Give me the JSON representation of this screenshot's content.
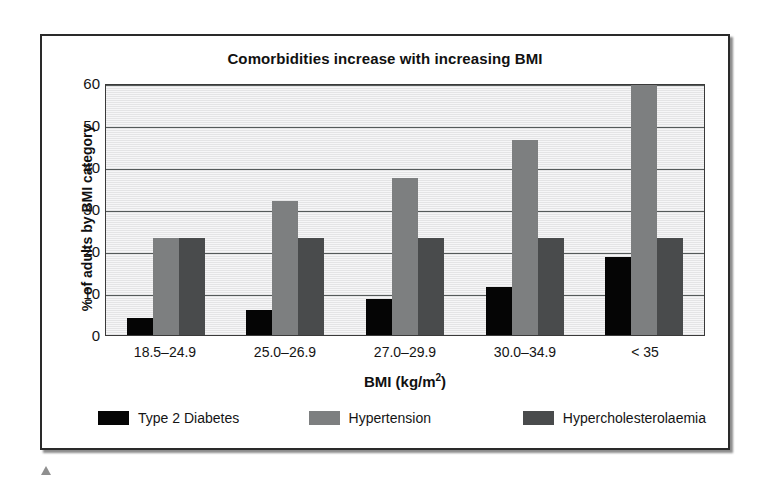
{
  "chart_data": {
    "type": "bar",
    "title": "Comorbidities increase with increasing BMI",
    "xlabel": "BMI (kg/m2)",
    "xlabel_base": "BMI (kg/m",
    "xlabel_sup": "2",
    "xlabel_close": ")",
    "ylabel": "% of adults by BMI category",
    "categories": [
      "18.5–24.9",
      "25.0–26.9",
      "27.0–29.9",
      "30.0–34.9",
      "< 35"
    ],
    "series": [
      {
        "name": "Type 2 Diabetes",
        "color": "#050505",
        "values": [
          4,
          6,
          8.5,
          11.5,
          18.5
        ]
      },
      {
        "name": "Hypertension",
        "color": "#7d7f80",
        "values": [
          23,
          32,
          37.5,
          46.5,
          59.5
        ]
      },
      {
        "name": "Hypercholesterolaemia",
        "color": "#494b4c",
        "values": [
          23,
          23,
          23,
          23,
          23
        ]
      }
    ],
    "ylim": [
      0,
      60
    ],
    "yticks": [
      60,
      50,
      40,
      30,
      20,
      10,
      0
    ],
    "gridlines": [
      60,
      50,
      40,
      30,
      20,
      10
    ],
    "grid": true,
    "legend_position": "bottom",
    "plot_background": "#ececed",
    "grid_color": "#555a5a"
  }
}
